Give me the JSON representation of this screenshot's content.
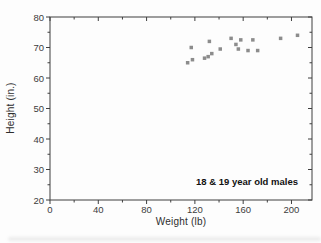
{
  "figure": {
    "annotation": "18 & 19 year old males"
  },
  "chart_data": {
    "type": "scatter",
    "title": "",
    "xlabel": "Weight (lb)",
    "ylabel": "Height (in.)",
    "xlim": [
      0,
      217
    ],
    "ylim": [
      20,
      80
    ],
    "x_major_ticks": [
      0,
      40,
      80,
      120,
      160,
      200
    ],
    "x_minor_ticks": [
      20,
      60,
      100,
      140,
      180
    ],
    "y_major_ticks": [
      20,
      30,
      40,
      50,
      60,
      70,
      80
    ],
    "y_minor_ticks": [
      25,
      35,
      45,
      55,
      65,
      75
    ],
    "grid": false,
    "legend_position": "none",
    "annotation": "18 & 19 year old males",
    "frame_color": "#3f3f3f",
    "marker": {
      "shape": "square",
      "size_px": 3.5,
      "color": "#8c8c8c"
    },
    "series": [
      {
        "name": "18 & 19 year old males",
        "points": [
          {
            "weight_lb": 114,
            "height_in": 65
          },
          {
            "weight_lb": 117,
            "height_in": 70
          },
          {
            "weight_lb": 118,
            "height_in": 66
          },
          {
            "weight_lb": 128,
            "height_in": 66.5
          },
          {
            "weight_lb": 131,
            "height_in": 67
          },
          {
            "weight_lb": 132,
            "height_in": 72
          },
          {
            "weight_lb": 134,
            "height_in": 68
          },
          {
            "weight_lb": 141,
            "height_in": 69.5
          },
          {
            "weight_lb": 150,
            "height_in": 73
          },
          {
            "weight_lb": 154,
            "height_in": 71
          },
          {
            "weight_lb": 156,
            "height_in": 69.5
          },
          {
            "weight_lb": 158,
            "height_in": 72.5
          },
          {
            "weight_lb": 164,
            "height_in": 69
          },
          {
            "weight_lb": 168,
            "height_in": 72.5
          },
          {
            "weight_lb": 172,
            "height_in": 69
          },
          {
            "weight_lb": 191,
            "height_in": 73
          },
          {
            "weight_lb": 205,
            "height_in": 74
          }
        ]
      }
    ]
  }
}
